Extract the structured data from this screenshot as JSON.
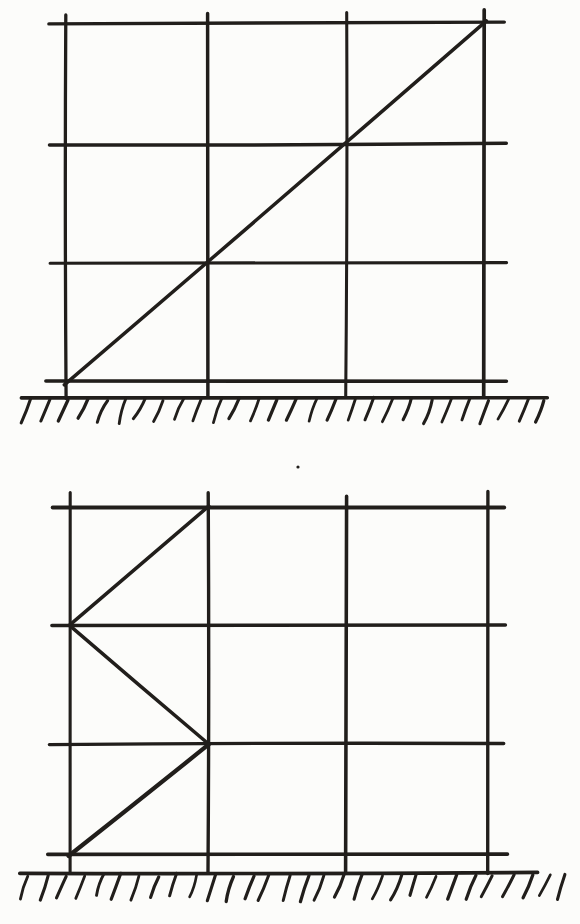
{
  "canvas": {
    "width": 580,
    "height": 924,
    "background": "#fcfcfa",
    "ink": "#211e1b"
  },
  "figures": [
    {
      "id": "frame-with-corner-diagonal",
      "label": "three-bay three-story frame, single diagonal brace from bottom-left to top-right",
      "columns_x": [
        66,
        207,
        346,
        484
      ],
      "beams_y": [
        23,
        144,
        263,
        382
      ],
      "beam_span": [
        46,
        504
      ],
      "column_span": [
        12,
        397
      ],
      "diagonals": [
        [
          65,
          384,
          486,
          21
        ]
      ],
      "ground": {
        "y": 397,
        "span": [
          22,
          548
        ],
        "hatch_span": [
          30,
          546
        ],
        "hatch_count": 28,
        "hatch_drop": 22,
        "hatch_lean": 9,
        "jitter": 1.6
      },
      "specks": []
    },
    {
      "id": "frame-with-zigzag-bracing",
      "label": "three-bay three-story frame, zig-zag bracing in left bay",
      "columns_x": [
        70,
        209,
        346,
        487
      ],
      "beams_y": [
        507,
        625,
        744,
        855
      ],
      "beam_span": [
        50,
        505
      ],
      "column_span": [
        494,
        873
      ],
      "diagonals": [
        [
          209,
          506,
          70,
          625
        ],
        [
          70,
          625,
          209,
          744
        ],
        [
          209,
          744,
          69,
          856
        ]
      ],
      "ground": {
        "y": 873,
        "span": [
          20,
          537
        ],
        "hatch_span": [
          28,
          568
        ],
        "hatch_count": 30,
        "hatch_drop": 23,
        "hatch_lean": 9,
        "jitter": 2.4
      },
      "specks": [
        [
          298,
          467
        ]
      ]
    }
  ]
}
